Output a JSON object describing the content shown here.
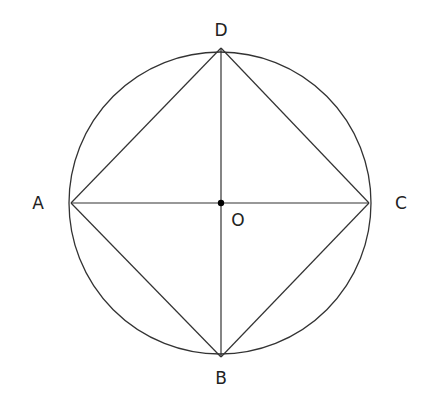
{
  "diagram": {
    "type": "geometry",
    "circle": {
      "center": "O",
      "cx": 220,
      "cy": 203,
      "r": 151
    },
    "points": {
      "A": {
        "label": "A",
        "x": 71,
        "y": 203
      },
      "B": {
        "label": "B",
        "x": 221,
        "y": 357
      },
      "C": {
        "label": "C",
        "x": 369,
        "y": 203
      },
      "D": {
        "label": "D",
        "x": 221,
        "y": 48
      },
      "O": {
        "label": "O",
        "x": 221,
        "y": 203
      }
    },
    "segments": [
      "AD",
      "DC",
      "CB",
      "BA",
      "AC",
      "DB"
    ],
    "colors": {
      "stroke": "#333333",
      "point": "#000000",
      "background": "#ffffff"
    }
  }
}
